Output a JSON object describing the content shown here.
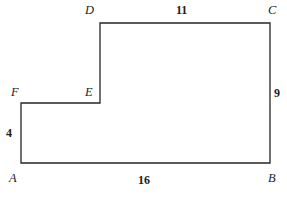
{
  "figure": {
    "stroke_color": "#262626",
    "background_color": "#ffffff",
    "stroke_width": 1.3,
    "vertices": [
      {
        "name": "A",
        "label": "A",
        "x": 21,
        "y": 163,
        "label_x": 9,
        "label_y": 172
      },
      {
        "name": "B",
        "label": "B",
        "x": 270,
        "y": 163,
        "label_x": 268,
        "label_y": 172
      },
      {
        "name": "C",
        "label": "C",
        "x": 270,
        "y": 23,
        "label_x": 268,
        "label_y": 4
      },
      {
        "name": "D",
        "label": "D",
        "x": 100,
        "y": 23,
        "label_x": 85,
        "label_y": 4
      },
      {
        "name": "E",
        "label": "E",
        "x": 100,
        "y": 103,
        "label_x": 85,
        "label_y": 86
      },
      {
        "name": "F",
        "label": "F",
        "x": 21,
        "y": 103,
        "label_x": 11,
        "label_y": 86
      }
    ],
    "path": "M 21 163 L 270 163 L 270 23 L 100 23 L 100 103 L 21 103 Z",
    "dimensions": [
      {
        "name": "dc-top",
        "edge": "DC",
        "value": "11",
        "x": 176,
        "y": 4
      },
      {
        "name": "cb-right",
        "edge": "CB",
        "value": "9",
        "x": 274,
        "y": 87
      },
      {
        "name": "ab-bottom",
        "edge": "AB",
        "value": "16",
        "x": 138,
        "y": 174
      },
      {
        "name": "fa-left",
        "edge": "FA",
        "value": "4",
        "x": 6,
        "y": 127
      }
    ]
  }
}
